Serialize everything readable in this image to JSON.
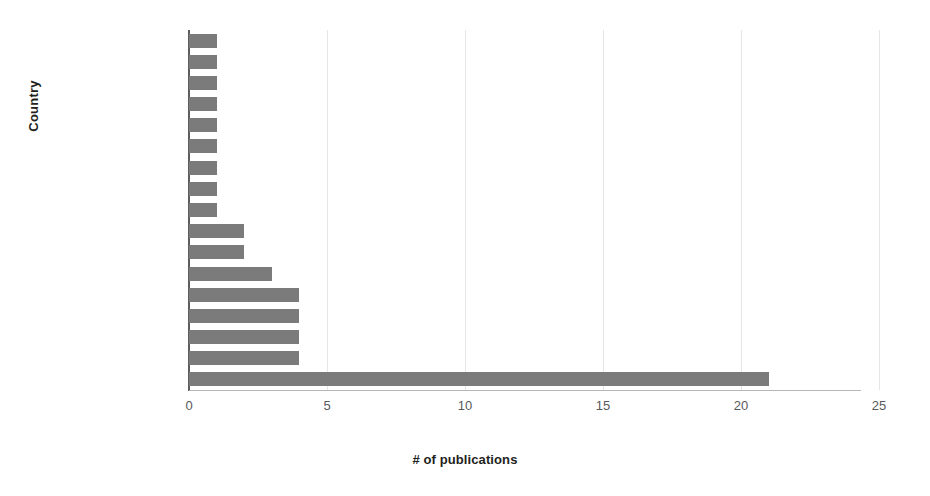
{
  "chart_data": {
    "type": "bar",
    "orientation": "horizontal",
    "title": "",
    "xlabel": "# of publications",
    "ylabel": "Country",
    "categories": [
      "N/A",
      "Greece",
      "Hong Kong",
      "Japan",
      "New Zealand",
      "Portugal",
      "Spain",
      "Switzerland",
      "Brazil",
      "France",
      "Netherlands",
      "Germany",
      "Australia",
      "Canada",
      "Italy",
      "UK",
      "U.S"
    ],
    "values": [
      1,
      1,
      1,
      1,
      1,
      1,
      1,
      1,
      1,
      2,
      2,
      3,
      4,
      4,
      4,
      4,
      21
    ],
    "xlim": [
      0,
      25
    ],
    "xticks": [
      0,
      5,
      10,
      15,
      20,
      25
    ],
    "xtick_labels": [
      "0",
      "5",
      "10",
      "15",
      "20",
      "25"
    ],
    "grid": true,
    "grid_axis": "x",
    "legend": false,
    "bar_color": "#7b7b7b",
    "axis_color": "#5d5d5d",
    "grid_color": "#e6e6e6",
    "text_color": "#231f20"
  }
}
